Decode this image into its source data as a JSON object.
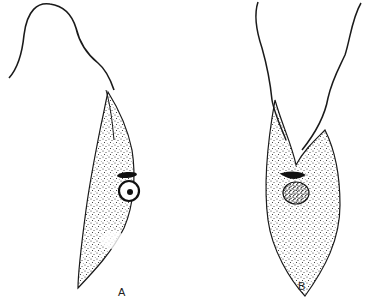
{
  "figure": {
    "panels": [
      {
        "label": "A",
        "description": "Slender trypanosome-like cell with long free flagellum curving up-left, undulating membrane, dark kinetoplast bar, round nucleus with central dot, stippled cytoplasm, pointed posterior end"
      },
      {
        "label": "B",
        "description": "Broader cell with two flagellar strands rising upward, dark kinetoplast bar, dense stippled nucleus, stippled cytoplasm, pointed posterior end"
      }
    ],
    "colors": {
      "ink": "#1a1a1a",
      "background": "#ffffff"
    }
  }
}
